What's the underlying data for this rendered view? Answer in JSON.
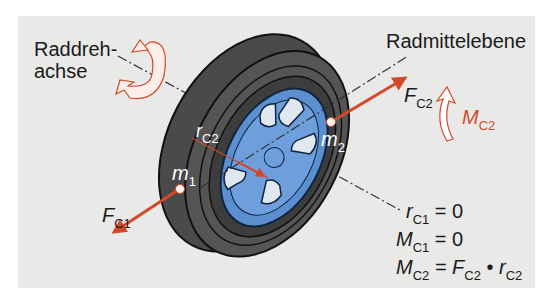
{
  "labels": {
    "wheel_axis": [
      "Raddreh-",
      "achse"
    ],
    "wheel_center_plane": "Radmittelebene"
  },
  "symbols": {
    "fc1": {
      "base": "F",
      "sub": "C1"
    },
    "fc2": {
      "base": "F",
      "sub": "C2"
    },
    "mc2": {
      "base": "M",
      "sub": "C2"
    },
    "rc2": {
      "base": "r",
      "sub": "C2"
    },
    "m1": {
      "base": "m",
      "sub": "1"
    },
    "m2": {
      "base": "m",
      "sub": "2"
    }
  },
  "equations": [
    {
      "lhs_base": "r",
      "lhs_sub": "C1",
      "rhs": "= 0"
    },
    {
      "lhs_base": "M",
      "lhs_sub": "C1",
      "rhs": "= 0"
    },
    {
      "lhs_base": "M",
      "lhs_sub": "C2",
      "rhs_a_base": "= F",
      "rhs_a_sub": "C2",
      "op": " • ",
      "rhs_b_base": "r",
      "rhs_b_sub": "C2"
    }
  ],
  "colors": {
    "panel": "#e9e9e7",
    "tire": "#4a4a4a",
    "rim": "#5b8fd0",
    "force_arrow": "#d2492a"
  }
}
